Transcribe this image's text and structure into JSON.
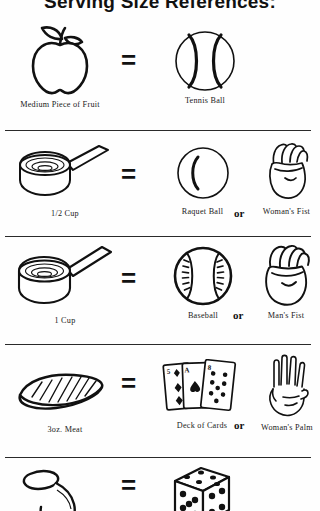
{
  "title": "Serving Size References:",
  "rows": [
    {
      "id": "row-fruit",
      "left_icon": "apple-icon",
      "left_label": "Medium Piece of Fruit",
      "operator": "=",
      "right_icon": "tennis-ball-icon",
      "right_label": "Tennis Ball",
      "conjunction": "",
      "alt_icon": "",
      "alt_label": ""
    },
    {
      "id": "row-half-cup",
      "left_icon": "measuring-cup-icon",
      "left_label": "1/2 Cup",
      "operator": "=",
      "right_icon": "racquet-ball-icon",
      "right_label": "Raquet Ball",
      "conjunction": "or",
      "alt_icon": "womans-fist-icon",
      "alt_label": "Woman's Fist"
    },
    {
      "id": "row-one-cup",
      "left_icon": "measuring-cup-icon",
      "left_label": "1 Cup",
      "operator": "=",
      "right_icon": "baseball-icon",
      "right_label": "Baseball",
      "conjunction": "or",
      "alt_icon": "mans-fist-icon",
      "alt_label": "Man's Fist"
    },
    {
      "id": "row-meat",
      "left_icon": "steak-meat-icon",
      "left_label": "3oz. Meat",
      "operator": "=",
      "right_icon": "deck-of-cards-icon",
      "right_label": "Deck of Cards",
      "conjunction": "or",
      "alt_icon": "womans-palm-icon",
      "alt_label": "Woman's Palm"
    },
    {
      "id": "row-spoon",
      "left_icon": "measuring-spoon-icon",
      "left_label": "",
      "operator": "=",
      "right_icon": "die-icon",
      "right_label": "",
      "conjunction": "",
      "alt_icon": "",
      "alt_label": ""
    }
  ],
  "colors": {
    "ink": "#1a1a1a",
    "paper": "#fefefe",
    "rule": "#2a2a2a"
  }
}
